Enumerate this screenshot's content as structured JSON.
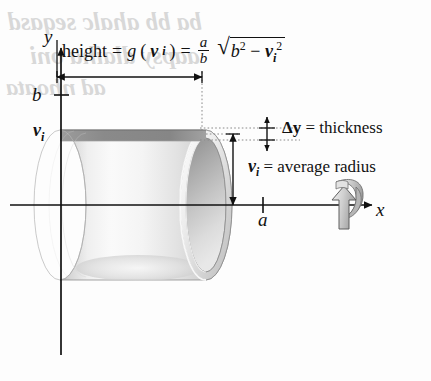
{
  "figure": {
    "kind": "shell-method-diagram",
    "axes": {
      "y_label": "y",
      "x_label": "x",
      "y_tick_label": "b",
      "x_tick_label": "a",
      "y_shell_label": "v",
      "y_shell_label_sub": "i"
    },
    "formula": {
      "lead": "height",
      "equals1": "=",
      "func_name": "g",
      "open_paren": "(",
      "func_arg": "v",
      "func_arg_sub": "i",
      "close_paren": ")",
      "equals2": "=",
      "frac_num": "a",
      "frac_den": "b",
      "radical_base": "b",
      "radical_base_sup": "2",
      "radical_minus": "−",
      "radical_term": "v",
      "radical_term_sub": "i",
      "radical_term_sup": "2",
      "full_text": "height = g(v_i) = (a/b)√(b² − v_i²)"
    },
    "annotations": {
      "thickness": {
        "symbol": "Δy",
        "equals": "=",
        "text": "thickness",
        "full": "Δy = thickness"
      },
      "radius": {
        "symbol": "v",
        "symbol_sub": "i",
        "equals": "=",
        "text": "average radius",
        "full": "v_i = average radius"
      }
    },
    "bleed_through": {
      "line1": "ba bb ahalc seqasd",
      "line2": "aapsy dlaiha oni",
      "line3": "ad nhoata"
    },
    "colors": {
      "ink": "#111111",
      "shell_light": "#f2f2f2",
      "shell_mid": "#c9c9c9",
      "shell_dark": "#9a9a9a",
      "shell_top_band": "#8e8e8e",
      "dotted_guide": "#8a8a8a",
      "background": "#fdfdfd"
    },
    "icons": {
      "rotation": "rotation-arrow-icon",
      "y_axis_arrow": "arrow-up-icon",
      "x_axis_arrow": "arrow-right-icon"
    }
  }
}
